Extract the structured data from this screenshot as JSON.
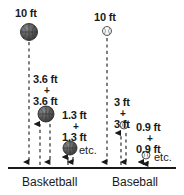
{
  "figure": {
    "title_absent": true,
    "baseline": {
      "y": 168,
      "x_start": 8,
      "x_end": 176
    },
    "groups": [
      {
        "name": "basketball",
        "axis_label": "Basketball",
        "axis_label_x": 22,
        "axis_label_y": 176,
        "ball_style": "basketball",
        "drop_label": "10 ft",
        "drop_label_x": 15,
        "drop_label_y": 8,
        "balls": [
          {
            "cx": 29,
            "cy": 32,
            "r": 8.5
          },
          {
            "cx": 46,
            "cy": 114,
            "r": 8
          },
          {
            "cx": 70,
            "cy": 148,
            "r": 7
          }
        ],
        "bounce_pairs": [
          {
            "top": "3.6 ft",
            "plus": "+",
            "bottom": "3.6 ft",
            "x": 33,
            "y_top": 74,
            "y_plus": 87,
            "y_bottom": 96
          },
          {
            "top": "1.3 ft",
            "plus": "+",
            "bottom": "1.3 ft",
            "x": 62,
            "y_top": 110,
            "y_plus": 123,
            "y_bottom": 132
          }
        ],
        "etc_label": "etc.",
        "etc_x": 79,
        "etc_y": 150
      },
      {
        "name": "baseball",
        "axis_label": "Baseball",
        "axis_label_x": 115,
        "axis_label_y": 176,
        "ball_style": "baseball",
        "drop_label": "10 ft",
        "drop_label_x": 94,
        "drop_label_y": 12,
        "balls": [
          {
            "cx": 107,
            "cy": 31,
            "r": 4.5
          },
          {
            "cx": 124,
            "cy": 125,
            "r": 4
          },
          {
            "cx": 146,
            "cy": 155,
            "r": 4
          }
        ],
        "bounce_pairs": [
          {
            "top": "3 ft",
            "plus": "+",
            "bottom": "3 ft",
            "x": 113,
            "y_top": 97,
            "y_plus": 110,
            "y_bottom": 119
          },
          {
            "top": "0.9 ft",
            "plus": "+",
            "bottom": "0.9 ft",
            "x": 138,
            "y_top": 122,
            "y_plus": 135,
            "y_bottom": 144
          }
        ],
        "etc_label": "etc.",
        "etc_x": 155,
        "etc_y": 157
      }
    ],
    "colors": {
      "basketball_fill": "#5a5a5a",
      "basketball_stroke": "#2e2e2e",
      "baseball_fill": "#f2f2f2",
      "baseball_stroke": "#4a4a4a",
      "line": "#1a1a1a",
      "text": "#1a1a1a",
      "background": "#ffffff"
    }
  }
}
